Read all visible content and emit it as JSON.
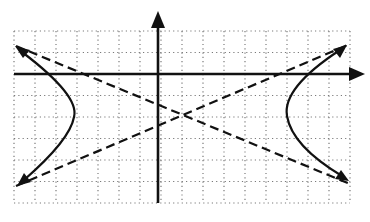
{
  "diagram": {
    "type": "hyperbola-graph",
    "colors": {
      "ink": "#111111",
      "grid": "#7a7a7a",
      "background": "#ffffff"
    },
    "grid": {
      "columns": 16,
      "rows": 8,
      "style": "dotted"
    },
    "axes": {
      "x_axis": {
        "arrow": "right"
      },
      "y_axis": {
        "arrow": "up"
      }
    },
    "asymptotes": {
      "count": 2,
      "style": "dashed"
    },
    "branches": [
      {
        "side": "left",
        "opens": "left",
        "arrows": "both-ends"
      },
      {
        "side": "right",
        "opens": "right",
        "arrows": "both-ends"
      }
    ]
  }
}
